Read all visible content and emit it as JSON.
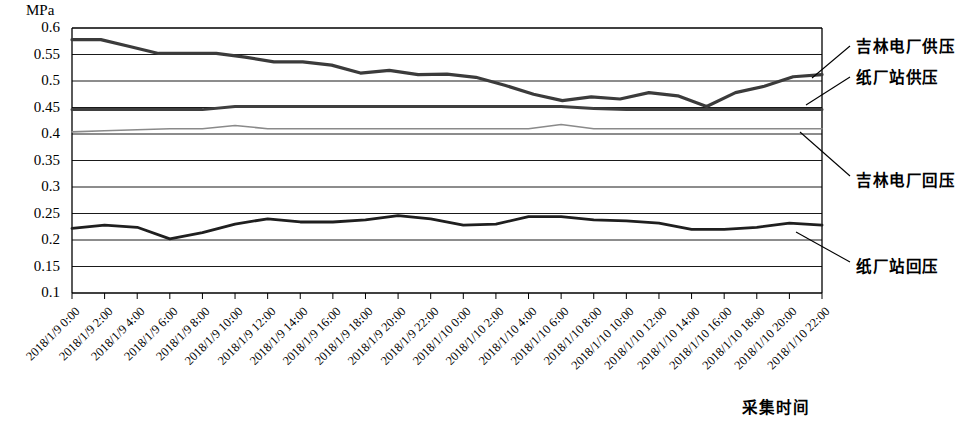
{
  "chart_data": {
    "type": "line",
    "title": "",
    "unit_label": "MPa",
    "ylabel": "MPa",
    "xlabel": "采集时间",
    "ylim": [
      0.1,
      0.6
    ],
    "ytick_values": [
      0.6,
      0.55,
      0.5,
      0.45,
      0.4,
      0.35,
      0.3,
      0.25,
      0.2,
      0.15,
      0.1
    ],
    "ytick_labels": [
      "0.6",
      "0.55",
      "0.5",
      "0.45",
      "0.4",
      "0.35",
      "0.3",
      "0.25",
      "0.2",
      "0.15",
      "0.1"
    ],
    "grid": true,
    "legend_position": "right-callouts",
    "categories": [
      "2018/1/9 0:00",
      "2018/1/9 2:00",
      "2018/1/9 4:00",
      "2018/1/9 6:00",
      "2018/1/9 8:00",
      "2018/1/9 10:00",
      "2018/1/9 12:00",
      "2018/1/9 14:00",
      "2018/1/9 16:00",
      "2018/1/9 18:00",
      "2018/1/9 20:00",
      "2018/1/9 22:00",
      "2018/1/10 0:00",
      "2018/1/10 2:00",
      "2018/1/10 4:00",
      "2018/1/10 6:00",
      "2018/1/10 8:00",
      "2018/1/10 10:00",
      "2018/1/10 12:00",
      "2018/1/10 14:00",
      "2018/1/10 16:00",
      "2018/1/10 18:00",
      "2018/1/10 20:00",
      "2018/1/10 22:00"
    ],
    "series": [
      {
        "name": "吉林电厂供压",
        "color": "#3b3b3b",
        "width": 3.2,
        "values": [
          0.578,
          0.578,
          0.578,
          0.562,
          0.552,
          0.552,
          0.552,
          0.552,
          0.54,
          0.536,
          0.536,
          0.536,
          0.528,
          0.513,
          0.52,
          0.515,
          0.513,
          0.512,
          0.513,
          0.51,
          0.505,
          0.506,
          0.5,
          0.492
        ]
      },
      {
        "name": "纸厂站供压",
        "color": "#3f3f3f",
        "width": 3.0,
        "values": [
          0.446,
          0.446,
          0.446,
          0.446,
          0.446,
          0.452,
          0.452,
          0.452,
          0.452,
          0.452,
          0.452,
          0.452,
          0.452,
          0.452,
          0.452,
          0.452,
          0.448,
          0.446,
          0.446,
          0.446,
          0.446,
          0.446,
          0.446,
          0.446
        ]
      },
      {
        "name": "吉林电厂回压",
        "color": "#8a8a8a",
        "width": 1.6,
        "values": [
          0.404,
          0.406,
          0.408,
          0.41,
          0.41,
          0.416,
          0.41,
          0.41,
          0.41,
          0.41,
          0.41,
          0.41,
          0.41,
          0.41,
          0.41,
          0.418,
          0.41,
          0.41,
          0.41,
          0.41,
          0.41,
          0.41,
          0.41,
          0.41
        ]
      },
      {
        "name": "纸厂站回压",
        "color": "#1f1f1f",
        "width": 2.8,
        "values": [
          0.222,
          0.228,
          0.224,
          0.202,
          0.214,
          0.23,
          0.24,
          0.234,
          0.234,
          0.238,
          0.246,
          0.24,
          0.228,
          0.23,
          0.244,
          0.244,
          0.238,
          0.236,
          0.232,
          0.22,
          0.22,
          0.224,
          0.232,
          0.228
        ]
      }
    ],
    "series_tail": {
      "吉林电厂供压": [
        0.578,
        0.578,
        0.565,
        0.552,
        0.552,
        0.552,
        0.545,
        0.536,
        0.536,
        0.53,
        0.515,
        0.52,
        0.512,
        0.513,
        0.507,
        0.492,
        0.475,
        0.463,
        0.47,
        0.466,
        0.478,
        0.472,
        0.452,
        0.478,
        0.49,
        0.508,
        0.512
      ]
    }
  },
  "callouts": [
    {
      "label": "吉林电厂供压",
      "x": 856,
      "y": 44
    },
    {
      "label": "纸厂站供压",
      "x": 856,
      "y": 75
    },
    {
      "label": "吉林电厂回压",
      "x": 856,
      "y": 178
    },
    {
      "label": "纸厂站回压",
      "x": 856,
      "y": 264
    }
  ],
  "plot": {
    "left": 72,
    "right": 822,
    "top": 28,
    "bottom": 293
  }
}
